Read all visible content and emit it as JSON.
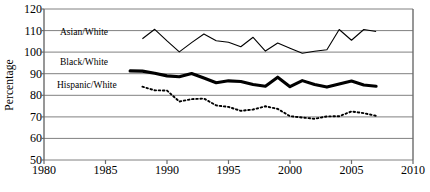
{
  "chart_data": {
    "type": "line",
    "title": "",
    "xlabel": "",
    "ylabel": "Percentage",
    "xlim": [
      1980,
      2010
    ],
    "ylim": [
      50,
      120
    ],
    "xticks": [
      1980,
      1985,
      1990,
      1995,
      2000,
      2005,
      2010
    ],
    "yticks": [
      50,
      60,
      70,
      80,
      90,
      100,
      110,
      120
    ],
    "grid": "horizontal",
    "legend_position": "inline-annotations",
    "series": [
      {
        "name": "Asian/White",
        "style": "thin-solid",
        "color": "#000000",
        "x": [
          1988,
          1989,
          1990,
          1991,
          1992,
          1993,
          1994,
          1995,
          1996,
          1997,
          1998,
          1999,
          2000,
          2001,
          2002,
          2003,
          2004,
          2005,
          2006,
          2007
        ],
        "values": [
          106.2,
          110.6,
          105.2,
          100.1,
          104.4,
          108.4,
          105.3,
          104.6,
          102.5,
          106.9,
          100.5,
          104.2,
          101.8,
          99.5,
          100.4,
          101.1,
          110.5,
          105.5,
          110.5,
          109.6
        ]
      },
      {
        "name": "Black/White",
        "style": "thick-solid",
        "color": "#000000",
        "x": [
          1987,
          1988,
          1989,
          1990,
          1991,
          1992,
          1993,
          1994,
          1995,
          1996,
          1997,
          1998,
          1999,
          2000,
          2001,
          2002,
          2003,
          2004,
          2005,
          2006,
          2007
        ],
        "values": [
          91.3,
          91.2,
          90.2,
          89.0,
          88.6,
          90.1,
          88.0,
          85.8,
          86.7,
          86.4,
          85.0,
          84.2,
          88.4,
          84.0,
          86.8,
          85.0,
          83.8,
          85.2,
          86.6,
          84.8,
          84.2
        ]
      },
      {
        "name": "Hispanic/White",
        "style": "dotted",
        "color": "#000000",
        "x": [
          1988,
          1989,
          1990,
          1991,
          1992,
          1993,
          1994,
          1995,
          1996,
          1997,
          1998,
          1999,
          2000,
          2001,
          2002,
          2003,
          2004,
          2005,
          2006,
          2007
        ],
        "values": [
          84.0,
          82.3,
          82.2,
          77.1,
          78.2,
          78.5,
          75.3,
          74.6,
          72.8,
          73.4,
          74.9,
          73.7,
          70.3,
          69.7,
          69.1,
          70.2,
          70.3,
          72.5,
          71.7,
          70.5
        ]
      }
    ],
    "annotations": [
      {
        "text": "Asian/White",
        "x_px": 60,
        "y_px": 31
      },
      {
        "text": "Black/White",
        "x_px": 60,
        "y_px": 61
      },
      {
        "text": "Hispanic/White",
        "x_px": 58,
        "y_px": 84
      }
    ]
  },
  "axes": {
    "y_axis_title": "Percentage",
    "y_tick_labels": [
      "120",
      "110",
      "100",
      "90",
      "80",
      "70",
      "60",
      "50"
    ],
    "x_tick_labels": [
      "1980",
      "1985",
      "1990",
      "1995",
      "2000",
      "2005",
      "2010"
    ]
  },
  "labels": {
    "asian_white": "Asian/White",
    "black_white": "Black/White",
    "hispanic_white": "Hispanic/White"
  }
}
